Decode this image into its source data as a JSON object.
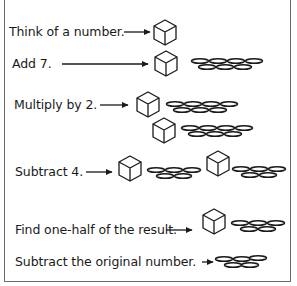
{
  "diagram": {
    "title": "",
    "colors": {
      "ink": "#1a1a1a",
      "frame": "#6a6a6a",
      "background": "#ffffff"
    },
    "legend": {
      "cube": "the original number",
      "coin": "one unit"
    },
    "steps": [
      {
        "id": "think",
        "label": "Think of a number.",
        "cubes": 1,
        "coins_per_cube_group": []
      },
      {
        "id": "add7",
        "label": "Add 7.",
        "cubes": 1,
        "coins_per_cube_group": [
          7
        ]
      },
      {
        "id": "multiply2",
        "label": "Multiply by 2.",
        "cubes": 2,
        "coins_per_cube_group": [
          7,
          7
        ]
      },
      {
        "id": "subtract4",
        "label": "Subtract 4.",
        "cubes": 2,
        "coins_per_cube_group": [
          5,
          5
        ]
      },
      {
        "id": "half",
        "label": "Find one-half of the result.",
        "cubes": 1,
        "coins_per_cube_group": [
          5
        ]
      },
      {
        "id": "subtract-original",
        "label": "Subtract the original number.",
        "cubes": 0,
        "coins_per_cube_group": [
          5
        ]
      }
    ]
  }
}
